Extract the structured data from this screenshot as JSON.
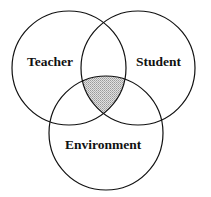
{
  "diagram": {
    "type": "venn",
    "sets": [
      {
        "id": "teacher",
        "label": "Teacher"
      },
      {
        "id": "student",
        "label": "Student"
      },
      {
        "id": "environment",
        "label": "Environment"
      }
    ],
    "highlighted_region": "intersection of Teacher, Student and Environment",
    "colors": {
      "stroke": "#111111",
      "fill_highlight": "#c8c8c8",
      "background": "#ffffff"
    }
  }
}
